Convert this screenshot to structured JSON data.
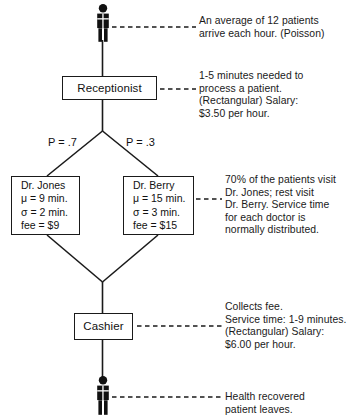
{
  "diagram": {
    "line_color": "#1a1a1a",
    "text_color": "#111111",
    "background": "#ffffff"
  },
  "nodes": {
    "arriving_patient": {
      "icon": "person-icon",
      "label": "arriving patient"
    },
    "receptionist": {
      "label": "Receptionist"
    },
    "doctor_jones": {
      "name": "Dr. Jones",
      "mean": "μ = 9 min.",
      "sigma": "σ = 2 min.",
      "fee": "fee =  $9"
    },
    "doctor_berry": {
      "name": "Dr. Berry",
      "mean": "μ = 15 min.",
      "sigma": "σ = 3 min.",
      "fee": "fee = $15"
    },
    "cashier": {
      "label": "Cashier"
    },
    "departing_patient": {
      "icon": "person-icon",
      "label": "departing patient"
    }
  },
  "branch_labels": {
    "left": "P = .7",
    "right": "P = .3"
  },
  "annotations": {
    "arrival": "An average of 12 patients\narrive each hour. (Poisson)",
    "receptionist": "1-5 minutes needed to\nprocess a patient.\n(Rectangular) Salary:\n$3.50 per hour.",
    "doctors": "70% of the patients visit\nDr. Jones; rest visit\nDr. Berry. Service time\nfor each doctor is\nnormally distributed.",
    "cashier": "Collects fee.\nService time: 1-9 minutes.\n(Rectangular) Salary:\n$6.00 per hour.",
    "departure": "Health recovered\npatient leaves."
  }
}
